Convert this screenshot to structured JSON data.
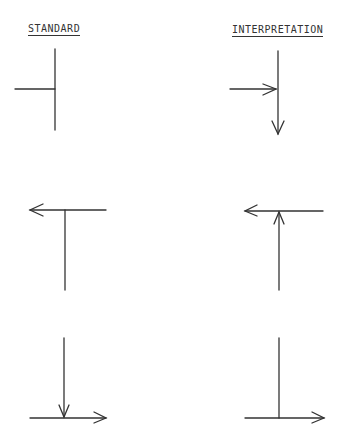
{
  "headers": {
    "standard": "STANDARD",
    "interpretation": "INTERPRETATION"
  },
  "colors": {
    "line": "#333333",
    "background": "#ffffff"
  },
  "rows": [
    {
      "standard": {
        "description": "horizontal line from left meets vertical line (T junction, no arrows)"
      },
      "interpretation": {
        "description": "arrow from left into vertical line, arrow continues downward"
      }
    },
    {
      "standard": {
        "description": "horizontal line with arrow pointing left, vertical line below"
      },
      "interpretation": {
        "description": "vertical line with arrow pointing up into horizontal line, arrow pointing left"
      }
    },
    {
      "standard": {
        "description": "vertical line with arrow pointing down onto horizontal line, arrow pointing right"
      },
      "interpretation": {
        "description": "vertical line meets horizontal line, arrow pointing right"
      }
    }
  ]
}
